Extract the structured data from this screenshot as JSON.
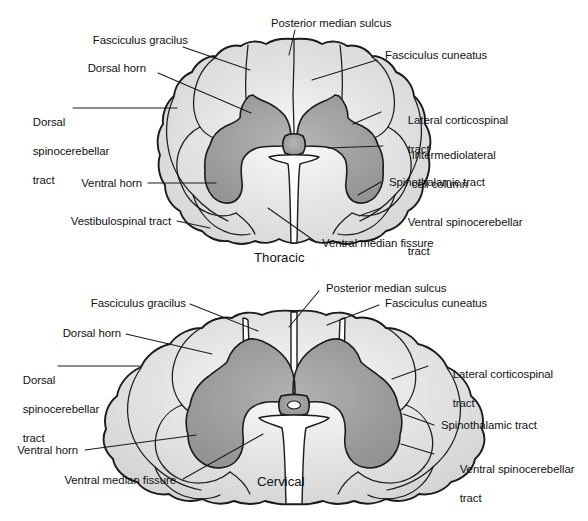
{
  "figure": {
    "colors": {
      "background": "#ffffff",
      "outline": "#1b1b1b",
      "white_matter": "#dcdcdc",
      "white_matter_highlight": "#f6f6f6",
      "gray_matter": "#9a9a9a",
      "gray_matter_highlight": "#b4b4b4",
      "text": "#111111"
    }
  },
  "panels": [
    {
      "id": "thoracic",
      "caption": "Thoracic",
      "labels": {
        "posterior_median_sulcus": "Posterior median sulcus",
        "fasciculus_gracilus": "Fasciculus gracilus",
        "fasciculus_cuneatus": "Fasciculus cuneatus",
        "dorsal_horn": "Dorsal horn",
        "dorsal_spinocerebellar_tract_l1": "Dorsal",
        "dorsal_spinocerebellar_tract_l2": "spinocerebellar",
        "dorsal_spinocerebellar_tract_l3": "tract",
        "lateral_corticospinal_tract_l1": "Lateral corticospinal",
        "lateral_corticospinal_tract_l2": "tract",
        "intermediolateral_cell_column_l1": "Intermediolateral",
        "intermediolateral_cell_column_l2": "cell column",
        "ventral_horn": "Ventral horn",
        "spinothalamic_tract": "Spinothalamic tract",
        "ventral_spinocerebellar_tract_l1": "Ventral spinocerebellar",
        "ventral_spinocerebellar_tract_l2": "tract",
        "vestibulospinal_tract": "Vestibulospinal tract",
        "ventral_median_fissure": "Ventral median fissure"
      }
    },
    {
      "id": "cervical",
      "caption": "Cervical",
      "labels": {
        "posterior_median_sulcus": "Posterior median sulcus",
        "fasciculus_gracilus": "Fasciculus gracilus",
        "fasciculus_cuneatus": "Fasciculus cuneatus",
        "dorsal_horn": "Dorsal horn",
        "dorsal_spinocerebellar_tract_l1": "Dorsal",
        "dorsal_spinocerebellar_tract_l2": "spinocerebellar",
        "dorsal_spinocerebellar_tract_l3": "tract",
        "lateral_corticospinal_tract_l1": "Lateral corticospinal",
        "lateral_corticospinal_tract_l2": "tract",
        "ventral_horn": "Ventral horn",
        "spinothalamic_tract": "Spinothalamic tract",
        "ventral_spinocerebellar_tract_l1": "Ventral spinocerebellar",
        "ventral_spinocerebellar_tract_l2": "tract",
        "ventral_median_fissure": "Ventral median fissure"
      }
    }
  ]
}
